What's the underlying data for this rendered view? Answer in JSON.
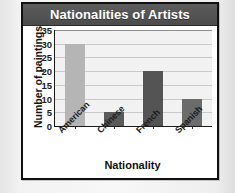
{
  "chart_data": {
    "type": "bar",
    "title": "Nationalities of Artists",
    "categories": [
      "American",
      "Chinese",
      "French",
      "Spanish"
    ],
    "values": [
      30,
      5,
      20,
      10
    ],
    "xlabel": "Nationality",
    "ylabel": "Number of paintings",
    "ylim": [
      0,
      35
    ],
    "ytick_labels": [
      "0",
      "5",
      "10",
      "15",
      "20",
      "25",
      "30",
      "35"
    ],
    "ytick_values": [
      0,
      5,
      10,
      15,
      20,
      25,
      30,
      35
    ],
    "grid": "horizontal",
    "legend": "none",
    "bar_colors": [
      "#b5b5b5",
      "#5a5a5a",
      "#545454",
      "#6b6b6b"
    ],
    "plot_background": "#f2f2f2",
    "title_banner_color": "#545454",
    "title_text_color": "#ffffff",
    "axis_color": "#1b1b1b",
    "gridline_color": "#c9c9c9"
  }
}
